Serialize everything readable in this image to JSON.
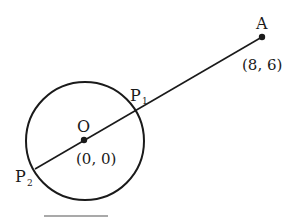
{
  "diagram": {
    "type": "geometry",
    "stroke_color": "#1a1a1a",
    "background": "#ffffff",
    "circle": {
      "center_label": "O",
      "center_coords": "(0, 0)"
    },
    "points": {
      "A": {
        "label": "A",
        "coords": "(8, 6)"
      },
      "P1": {
        "label": "P",
        "subscript": "1"
      },
      "P2": {
        "label": "P",
        "subscript": "2"
      }
    },
    "segments": [
      "P2-A through O"
    ]
  }
}
